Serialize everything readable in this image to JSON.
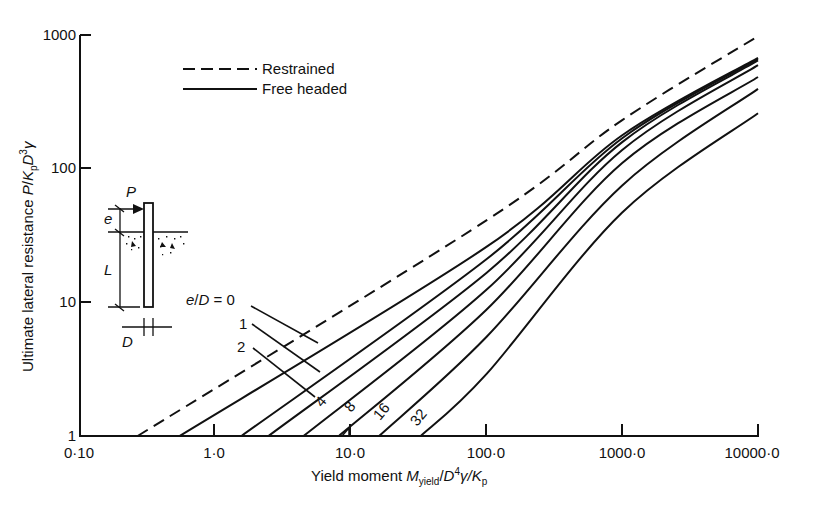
{
  "chart_data": {
    "type": "line",
    "xscale": "log",
    "yscale": "log",
    "xlabel": "Yield moment M_yield/D^4 γ K_p",
    "ylabel": "Ultimate lateral resistance P/K_p D^3 γ",
    "xlim": [
      0.1,
      10000
    ],
    "ylim": [
      1,
      1000
    ],
    "x_ticks": [
      0.1,
      1,
      10,
      100,
      1000,
      10000
    ],
    "x_tick_labels": [
      "0·10",
      "1·0",
      "10·0",
      "100·0",
      "1000·0",
      "10000·0"
    ],
    "y_ticks": [
      1,
      10,
      100,
      1000
    ],
    "y_tick_labels": [
      "1",
      "10",
      "100",
      "1000"
    ],
    "grid": false,
    "legend": {
      "position": "upper-left",
      "entries": [
        {
          "label": "Restrained",
          "style": "dashed"
        },
        {
          "label": "Free headed",
          "style": "solid"
        }
      ]
    },
    "series": [
      {
        "name": "Restrained",
        "style": "dashed",
        "x": [
          0.27,
          100,
          1000,
          10000
        ],
        "y": [
          1,
          41,
          231,
          980
        ]
      },
      {
        "name": "e/D = 0",
        "style": "solid",
        "x": [
          0.55,
          100,
          1000,
          10000
        ],
        "y": [
          1,
          26,
          178,
          675
        ]
      },
      {
        "name": "e/D = 1",
        "style": "solid",
        "x": [
          1.57,
          100,
          1000,
          10000
        ],
        "y": [
          1,
          21,
          169,
          660
        ]
      },
      {
        "name": "e/D = 2",
        "style": "solid",
        "x": [
          2.48,
          100,
          1000,
          10000
        ],
        "y": [
          1,
          16.6,
          158,
          645
        ]
      },
      {
        "name": "e/D = 4",
        "style": "solid",
        "x": [
          4.5,
          100,
          1000,
          10000
        ],
        "y": [
          1,
          12.4,
          138,
          595
        ]
      },
      {
        "name": "e/D = 8",
        "style": "solid",
        "x": [
          8.2,
          100,
          1000,
          10000
        ],
        "y": [
          1,
          8.8,
          110,
          485
        ]
      },
      {
        "name": "e/D = 16",
        "style": "solid",
        "x": [
          16.2,
          100,
          1000,
          10000
        ],
        "y": [
          1,
          5.5,
          75,
          395
        ]
      },
      {
        "name": "e/D = 32",
        "style": "solid",
        "x": [
          32.9,
          100,
          1000,
          10000
        ],
        "y": [
          1,
          2.9,
          47,
          260
        ]
      }
    ],
    "annotations": [
      {
        "text": "e/D = 0",
        "target": "e/D = 0"
      },
      {
        "text": "1",
        "target": "e/D = 1"
      },
      {
        "text": "2",
        "target": "e/D = 2"
      },
      {
        "text": "4",
        "target": "e/D = 4"
      },
      {
        "text": "8",
        "target": "e/D = 8"
      },
      {
        "text": "16",
        "target": "e/D = 16"
      },
      {
        "text": "32",
        "target": "e/D = 32"
      }
    ],
    "inset_diagram": {
      "description": "Pile with lateral load P at eccentricity e above ground, embedded length L, diameter D",
      "labels": [
        "P",
        "e",
        "L",
        "D"
      ]
    }
  },
  "labels": {
    "y_axis": {
      "main": "Ultimate lateral resistance ",
      "p": "P",
      "slash": "/",
      "k": "K",
      "k_sub": "p",
      "d": "D",
      "d_sup": "3",
      "gamma": "γ"
    },
    "x_axis": {
      "main": "Yield moment ",
      "m": "M",
      "m_sub": "yield",
      "slash": "/",
      "d": "D",
      "d_sup": "4",
      "gamma": "γ",
      "k": "K",
      "k_sub": "p"
    },
    "legend": {
      "restrained": "Restrained",
      "free": "Free headed"
    },
    "curve_labels": {
      "ed0_prefix_e": "e",
      "ed0_slash": "/",
      "ed0_D": "D",
      "ed0_eq": " = 0",
      "l1": "1",
      "l2": "2",
      "l4": "4",
      "l8": "8",
      "l16": "16",
      "l32": "32"
    },
    "inset": {
      "P": "P",
      "e": "e",
      "L": "L",
      "D": "D"
    },
    "x_ticks": [
      "0·10",
      "1·0",
      "10·0",
      "100·0",
      "1000·0",
      "10000·0"
    ],
    "y_ticks": [
      "1",
      "10",
      "100",
      "1000"
    ]
  }
}
